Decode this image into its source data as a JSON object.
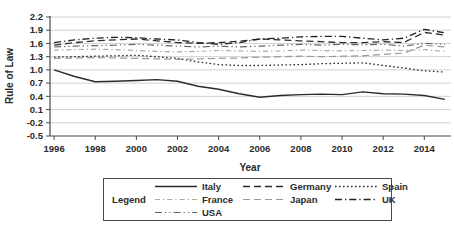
{
  "legend": {
    "title": "Legend"
  },
  "chart_data": {
    "type": "line",
    "title": "",
    "xlabel": "Year",
    "ylabel": "Rule of Law",
    "grid": true,
    "legend_position": "bottom-box",
    "x": [
      1996,
      1997,
      1998,
      1999,
      2000,
      2001,
      2002,
      2003,
      2004,
      2005,
      2006,
      2007,
      2008,
      2009,
      2010,
      2011,
      2012,
      2013,
      2014,
      2015
    ],
    "x_ticks": [
      1996,
      1998,
      2000,
      2002,
      2004,
      2006,
      2008,
      2010,
      2012,
      2014
    ],
    "y_ticks": [
      2.2,
      1.9,
      1.6,
      1.3,
      1.0,
      0.7,
      0.4,
      0.1,
      -0.2,
      -0.5
    ],
    "xlim": [
      1995.8,
      2015.2
    ],
    "ylim": [
      -0.5,
      2.2
    ],
    "axis_color": "#4a4a4a",
    "grid_color": "#cccccc",
    "series": [
      {
        "name": "Italy",
        "color": "#2b2b2b",
        "dash": "",
        "width": 1.4,
        "values": [
          1.0,
          0.85,
          0.73,
          0.74,
          0.76,
          0.78,
          0.74,
          0.63,
          0.56,
          0.46,
          0.38,
          0.42,
          0.44,
          0.45,
          0.44,
          0.5,
          0.46,
          0.45,
          0.42,
          0.33
        ]
      },
      {
        "name": "Germany",
        "color": "#2b2b2b",
        "dash": "7 4",
        "width": 1.3,
        "values": [
          1.56,
          1.62,
          1.66,
          1.68,
          1.7,
          1.66,
          1.62,
          1.6,
          1.62,
          1.65,
          1.7,
          1.68,
          1.66,
          1.64,
          1.62,
          1.62,
          1.64,
          1.62,
          1.85,
          1.79
        ]
      },
      {
        "name": "Spain",
        "color": "#2b2b2b",
        "dash": "1.6 2.4",
        "width": 1.3,
        "values": [
          1.29,
          1.3,
          1.31,
          1.32,
          1.33,
          1.3,
          1.26,
          1.18,
          1.12,
          1.1,
          1.1,
          1.11,
          1.12,
          1.14,
          1.15,
          1.16,
          1.1,
          1.04,
          0.98,
          0.95
        ]
      },
      {
        "name": "France",
        "color": "#a8a8a8",
        "dash": "5 3 1.3 3",
        "width": 1.2,
        "values": [
          1.45,
          1.46,
          1.47,
          1.46,
          1.44,
          1.42,
          1.41,
          1.42,
          1.44,
          1.43,
          1.42,
          1.43,
          1.45,
          1.44,
          1.43,
          1.44,
          1.45,
          1.44,
          1.46,
          1.42
        ]
      },
      {
        "name": "Japan",
        "color": "#999999",
        "dash": "7 4",
        "width": 1.2,
        "values": [
          1.26,
          1.27,
          1.28,
          1.27,
          1.26,
          1.25,
          1.24,
          1.25,
          1.26,
          1.27,
          1.29,
          1.3,
          1.31,
          1.3,
          1.31,
          1.32,
          1.35,
          1.38,
          1.56,
          1.52
        ]
      },
      {
        "name": "UK",
        "color": "#222222",
        "dash": "7 3 1.3 3",
        "width": 1.3,
        "values": [
          1.62,
          1.68,
          1.72,
          1.74,
          1.73,
          1.7,
          1.68,
          1.62,
          1.58,
          1.62,
          1.7,
          1.72,
          1.75,
          1.76,
          1.76,
          1.72,
          1.68,
          1.72,
          1.92,
          1.84
        ]
      },
      {
        "name": "USA",
        "color": "#666666",
        "dash": "7 3 1.3 3 1.3 3",
        "width": 1.2,
        "values": [
          1.52,
          1.54,
          1.55,
          1.56,
          1.58,
          1.56,
          1.54,
          1.52,
          1.54,
          1.52,
          1.54,
          1.56,
          1.58,
          1.56,
          1.58,
          1.57,
          1.58,
          1.54,
          1.6,
          1.58
        ]
      }
    ]
  }
}
